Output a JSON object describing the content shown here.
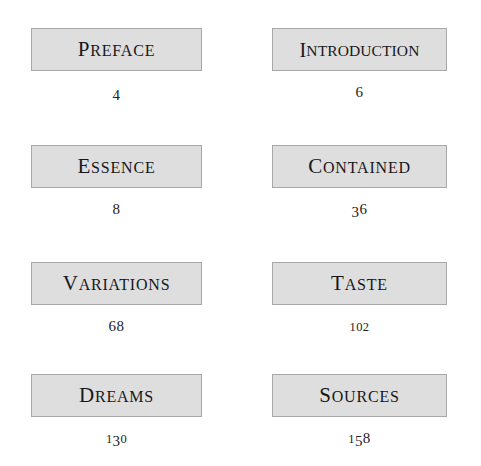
{
  "page": {
    "kind": "table-of-contents",
    "background_color": "#ffffff",
    "box_fill_color": "#dedede",
    "box_border_color": "#a8a8a8",
    "box_highlight_color": "#ffffff",
    "text_color": "#17171a",
    "number_color": "#232326",
    "columns": 2,
    "rows": 4
  },
  "entries": [
    {
      "label": "PREFACE",
      "page_number": "4",
      "column": "left",
      "row": 1
    },
    {
      "label": "INTRODUCTION",
      "page_number": "6",
      "column": "right",
      "row": 1
    },
    {
      "label": "ESSENCE",
      "page_number": "8",
      "column": "left",
      "row": 2
    },
    {
      "label": "CONTAINED",
      "page_number": "36",
      "column": "right",
      "row": 2
    },
    {
      "label": "VARIATIONS",
      "page_number": "68",
      "column": "left",
      "row": 3
    },
    {
      "label": "TASTE",
      "page_number": "102",
      "column": "right",
      "row": 3
    },
    {
      "label": "DREAMS",
      "page_number": "130",
      "column": "left",
      "row": 4
    },
    {
      "label": "SOURCES",
      "page_number": "158",
      "column": "right",
      "row": 4
    }
  ]
}
